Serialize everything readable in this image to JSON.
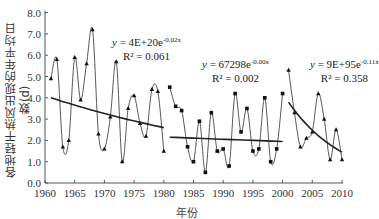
{
  "chart_data": {
    "type": "line",
    "title": "",
    "xlabel": "年份",
    "ylabel": "各地轻干热风出现的年平均日数(d)",
    "xlim": [
      1960,
      2010
    ],
    "ylim": [
      0.0,
      8.0
    ],
    "x_ticks": [
      "1960",
      "1965",
      "1970",
      "1975",
      "1980",
      "1985",
      "1990",
      "1995",
      "2000",
      "2005",
      "2010"
    ],
    "y_ticks": [
      "0.0",
      "1.0",
      "2.0",
      "3.0",
      "4.0",
      "5.0",
      "6.0",
      "7.0",
      "8.0"
    ],
    "grid": false,
    "series": [
      {
        "name": "1961-1980",
        "marker": "triangle",
        "x": [
          1961,
          1962,
          1963,
          1964,
          1965,
          1966,
          1967,
          1968,
          1969,
          1970,
          1971,
          1972,
          1973,
          1974,
          1975,
          1976,
          1977,
          1978,
          1979,
          1980
        ],
        "values": [
          4.9,
          5.8,
          1.7,
          2.0,
          5.9,
          3.9,
          5.6,
          7.2,
          2.3,
          1.6,
          3.1,
          5.7,
          1.0,
          3.5,
          4.1,
          2.8,
          2.2,
          4.4,
          4.3,
          1.5
        ],
        "trend": {
          "equation": "y = 4E+20e^-0.02x",
          "r2": "R² = 0.061",
          "x": [
            1961,
            1980
          ],
          "y": [
            4.0,
            2.6
          ]
        }
      },
      {
        "name": "1981-2000",
        "marker": "square",
        "x": [
          1981,
          1982,
          1983,
          1984,
          1985,
          1986,
          1987,
          1988,
          1989,
          1990,
          1991,
          1992,
          1993,
          1994,
          1995,
          1996,
          1997,
          1998,
          1999,
          2000
        ],
        "values": [
          4.5,
          3.6,
          3.4,
          1.7,
          1.0,
          2.9,
          0.5,
          3.3,
          1.5,
          1.6,
          0.8,
          4.2,
          2.4,
          3.5,
          1.5,
          1.6,
          4.0,
          1.0,
          1.6,
          4.2
        ],
        "trend": {
          "equation": "y = 67298e^-0.00x",
          "r2": "R² = 0.002",
          "x": [
            1981,
            2000
          ],
          "y": [
            2.15,
            1.95
          ]
        }
      },
      {
        "name": "2001-2010",
        "marker": "triangle",
        "x": [
          2001,
          2002,
          2003,
          2004,
          2005,
          2006,
          2007,
          2008,
          2009,
          2010
        ],
        "values": [
          5.3,
          3.3,
          1.7,
          2.1,
          2.4,
          4.2,
          3.0,
          1.1,
          2.5,
          1.1
        ],
        "trend": {
          "equation": "y = 9E+95e^-0.11x",
          "r2": "R² = 0.358",
          "x": [
            2001,
            2010
          ],
          "y": [
            3.8,
            1.45
          ]
        }
      }
    ]
  },
  "labels": {
    "xlabel": "年份",
    "ylabel": "各地轻干热风出现的年平均日数(d)",
    "eq1": {
      "prefix": "y = 4E+20e",
      "exp": "-0.02x",
      "r2": "R² = 0.061"
    },
    "eq2": {
      "prefix": "y = 67298e",
      "exp": "-0.00x",
      "r2": "R² = 0.002"
    },
    "eq3": {
      "prefix": "y = 9E+95e",
      "exp": "-0.11x",
      "r2": "R² = 0.358"
    }
  },
  "colors": {
    "line": "#444444",
    "trend": "#222222",
    "axis": "#555555"
  }
}
